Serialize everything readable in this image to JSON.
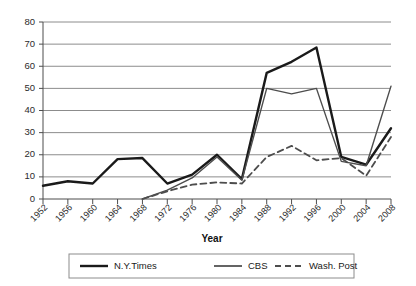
{
  "chart_data": {
    "type": "line",
    "title": "",
    "xlabel": "Year",
    "ylabel": "",
    "ylim": [
      0,
      80
    ],
    "yticks": [
      0,
      10,
      20,
      30,
      40,
      50,
      60,
      70,
      80
    ],
    "grid": true,
    "legend_position": "bottom",
    "categories": [
      "1952",
      "1956",
      "1960",
      "1964",
      "1968",
      "1972",
      "1976",
      "1980",
      "1984",
      "1988",
      "1992",
      "1996",
      "2000",
      "2004",
      "2008"
    ],
    "series": [
      {
        "name": "N.Y.Times",
        "style": "solid-thick",
        "color": "#1a1a1a",
        "values": [
          6,
          8,
          7,
          18,
          18.5,
          7,
          11,
          20,
          9,
          57,
          62,
          68.5,
          19,
          15.5,
          32
        ]
      },
      {
        "name": "CBS",
        "style": "solid-thin",
        "color": "#4d4d4d",
        "values": [
          null,
          null,
          null,
          null,
          0,
          4,
          9.5,
          19,
          8.5,
          50,
          47.5,
          50,
          17,
          15,
          51
        ]
      },
      {
        "name": "Wash. Post",
        "style": "dashed",
        "color": "#4d4d4d",
        "values": [
          null,
          null,
          null,
          null,
          0,
          3.5,
          6.5,
          7.5,
          7,
          19,
          24,
          17.5,
          18.5,
          10.5,
          28
        ]
      }
    ]
  },
  "legend": {
    "items": [
      {
        "label": "N.Y.Times",
        "swatch": "solid-thick"
      },
      {
        "label": "CBS",
        "swatch": "solid-thin"
      },
      {
        "label": "Wash. Post",
        "swatch": "dashed"
      }
    ]
  },
  "axis": {
    "x_title": "Year"
  }
}
